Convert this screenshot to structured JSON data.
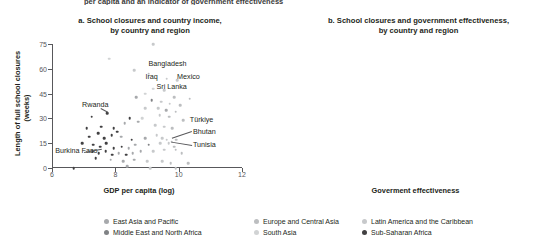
{
  "top_caption": "per capita and an indicator of government effectiveness",
  "panel_a": {
    "title_line1": "a. School closures and country income,",
    "title_line2": "by country and region"
  },
  "panel_b": {
    "title_line1": "b. School closures and government effectiveness,",
    "title_line2": "by country and region"
  },
  "legend": {
    "items": [
      {
        "label": "East Asia and Pacific",
        "color": "#a7a9ac",
        "col": 0,
        "row": 0
      },
      {
        "label": "Middle East and North Africa",
        "color": "#808285",
        "col": 0,
        "row": 1
      },
      {
        "label": "Europe and Central Asia",
        "color": "#bcbec0",
        "col": 1,
        "row": 0
      },
      {
        "label": "South Asia",
        "color": "#d1d3d4",
        "col": 1,
        "row": 1
      },
      {
        "label": "Latin America and the Caribbean",
        "color": "#c7c9cb",
        "col": 2,
        "row": 0
      },
      {
        "label": "Sub-Saharan Africa",
        "color": "#414042",
        "col": 2,
        "row": 1
      }
    ]
  },
  "chart_data": [
    {
      "type": "scatter",
      "panel": "a",
      "title": "a. School closures and country income, by country and region",
      "xlabel": "GDP per capita (log)",
      "ylabel": "Length of full school closures (weeks)",
      "xlim": [
        6,
        12
      ],
      "ylim": [
        0,
        75
      ],
      "xticks": [
        6,
        8,
        10,
        12
      ],
      "yticks": [
        0,
        15,
        30,
        45,
        60,
        75
      ],
      "grid": false,
      "legend_position": "bottom",
      "annotations": [
        {
          "label": "Bangladesh",
          "x": 9.05,
          "y": 63,
          "anchor": "left",
          "leader": false
        },
        {
          "label": "Iraq",
          "x": 8.95,
          "y": 55,
          "anchor": "left",
          "leader": false
        },
        {
          "label": "Mexico",
          "x": 9.95,
          "y": 55,
          "anchor": "left",
          "leader": false
        },
        {
          "label": "Sri Lanka",
          "x": 9.3,
          "y": 49,
          "anchor": "left",
          "leader": false
        },
        {
          "label": "Rwanda",
          "x": 6.95,
          "y": 38,
          "anchor": "left",
          "leader": true
        },
        {
          "label": "Türkiye",
          "x": 10.35,
          "y": 29,
          "anchor": "left",
          "leader": false
        },
        {
          "label": "Bhutan",
          "x": 10.45,
          "y": 22,
          "anchor": "left",
          "leader": true
        },
        {
          "label": "Tunisia",
          "x": 10.45,
          "y": 14,
          "anchor": "left",
          "leader": true
        },
        {
          "label": "Burkina Faso",
          "x": 6.1,
          "y": 10,
          "anchor": "left",
          "leader": true
        }
      ],
      "points": [
        {
          "x": 7.8,
          "y": 66,
          "g": "sa"
        },
        {
          "x": 9.2,
          "y": 75,
          "g": "lac"
        },
        {
          "x": 8.6,
          "y": 59,
          "g": "lac"
        },
        {
          "x": 9.05,
          "y": 57,
          "g": "eca"
        },
        {
          "x": 9.62,
          "y": 54,
          "g": "lac"
        },
        {
          "x": 9.95,
          "y": 53,
          "g": "lac"
        },
        {
          "x": 9.2,
          "y": 48,
          "g": "sa"
        },
        {
          "x": 9.55,
          "y": 47,
          "g": "lac"
        },
        {
          "x": 8.95,
          "y": 45,
          "g": "sa"
        },
        {
          "x": 8.65,
          "y": 43,
          "g": "eap"
        },
        {
          "x": 9.85,
          "y": 43,
          "g": "eca"
        },
        {
          "x": 10.35,
          "y": 42,
          "g": "eca"
        },
        {
          "x": 9.15,
          "y": 41,
          "g": "mena"
        },
        {
          "x": 9.45,
          "y": 40,
          "g": "lac"
        },
        {
          "x": 9.72,
          "y": 39,
          "g": "lac"
        },
        {
          "x": 10.05,
          "y": 38,
          "g": "eca"
        },
        {
          "x": 7.75,
          "y": 33,
          "g": "ssa"
        },
        {
          "x": 8.95,
          "y": 36,
          "g": "lac"
        },
        {
          "x": 9.35,
          "y": 36,
          "g": "lac"
        },
        {
          "x": 9.6,
          "y": 35,
          "g": "eap"
        },
        {
          "x": 9.9,
          "y": 34,
          "g": "eca"
        },
        {
          "x": 7.25,
          "y": 31,
          "g": "ssa"
        },
        {
          "x": 8.45,
          "y": 30,
          "g": "ssa"
        },
        {
          "x": 8.85,
          "y": 30,
          "g": "sa"
        },
        {
          "x": 9.4,
          "y": 32,
          "g": "lac"
        },
        {
          "x": 9.7,
          "y": 31,
          "g": "eca"
        },
        {
          "x": 10.15,
          "y": 29,
          "g": "eca"
        },
        {
          "x": 7.1,
          "y": 24,
          "g": "ssa"
        },
        {
          "x": 7.55,
          "y": 25,
          "g": "ssa"
        },
        {
          "x": 7.95,
          "y": 24,
          "g": "ssa"
        },
        {
          "x": 8.05,
          "y": 22,
          "g": "ssa"
        },
        {
          "x": 8.3,
          "y": 27,
          "g": "eap"
        },
        {
          "x": 8.72,
          "y": 28,
          "g": "eap"
        },
        {
          "x": 9.25,
          "y": 26,
          "g": "lac"
        },
        {
          "x": 9.55,
          "y": 25,
          "g": "lac"
        },
        {
          "x": 9.8,
          "y": 24,
          "g": "eca"
        },
        {
          "x": 7.18,
          "y": 19,
          "g": "ssa"
        },
        {
          "x": 7.45,
          "y": 21,
          "g": "ssa"
        },
        {
          "x": 7.65,
          "y": 18,
          "g": "ssa"
        },
        {
          "x": 7.88,
          "y": 20,
          "g": "ssa"
        },
        {
          "x": 8.18,
          "y": 19,
          "g": "eap"
        },
        {
          "x": 8.52,
          "y": 17,
          "g": "ssa"
        },
        {
          "x": 8.95,
          "y": 18,
          "g": "eap"
        },
        {
          "x": 9.3,
          "y": 20,
          "g": "lac"
        },
        {
          "x": 9.48,
          "y": 18,
          "g": "lac"
        },
        {
          "x": 9.62,
          "y": 17,
          "g": "lac"
        },
        {
          "x": 9.78,
          "y": 16,
          "g": "eca"
        },
        {
          "x": 9.92,
          "y": 17,
          "g": "eca"
        },
        {
          "x": 6.95,
          "y": 15,
          "g": "ssa"
        },
        {
          "x": 7.3,
          "y": 14,
          "g": "ssa"
        },
        {
          "x": 7.52,
          "y": 13,
          "g": "ssa"
        },
        {
          "x": 7.72,
          "y": 15,
          "g": "ssa"
        },
        {
          "x": 7.95,
          "y": 12,
          "g": "ssa"
        },
        {
          "x": 8.2,
          "y": 13,
          "g": "ssa"
        },
        {
          "x": 8.42,
          "y": 12,
          "g": "eap"
        },
        {
          "x": 8.62,
          "y": 14,
          "g": "eap"
        },
        {
          "x": 9.05,
          "y": 14,
          "g": "mena"
        },
        {
          "x": 9.42,
          "y": 15,
          "g": "lac"
        },
        {
          "x": 9.68,
          "y": 15,
          "g": "lac"
        },
        {
          "x": 9.85,
          "y": 13,
          "g": "eca"
        },
        {
          "x": 7.28,
          "y": 10,
          "g": "ssa"
        },
        {
          "x": 7.48,
          "y": 9,
          "g": "ssa"
        },
        {
          "x": 7.7,
          "y": 10,
          "g": "ssa"
        },
        {
          "x": 7.9,
          "y": 8,
          "g": "ssa"
        },
        {
          "x": 8.1,
          "y": 9,
          "g": "eap"
        },
        {
          "x": 8.35,
          "y": 8,
          "g": "ssa"
        },
        {
          "x": 8.55,
          "y": 9,
          "g": "eap"
        },
        {
          "x": 8.8,
          "y": 10,
          "g": "eap"
        },
        {
          "x": 9.2,
          "y": 10,
          "g": "lac"
        },
        {
          "x": 9.55,
          "y": 11,
          "g": "lac"
        },
        {
          "x": 9.9,
          "y": 11,
          "g": "eca"
        },
        {
          "x": 10.1,
          "y": 9,
          "g": "eca"
        },
        {
          "x": 7.38,
          "y": 6,
          "g": "ssa"
        },
        {
          "x": 7.85,
          "y": 5,
          "g": "eap"
        },
        {
          "x": 8.25,
          "y": 4,
          "g": "eap"
        },
        {
          "x": 8.6,
          "y": 5,
          "g": "eap"
        },
        {
          "x": 9.0,
          "y": 4,
          "g": "lac"
        },
        {
          "x": 9.48,
          "y": 4,
          "g": "lac"
        },
        {
          "x": 9.75,
          "y": 3,
          "g": "eca"
        },
        {
          "x": 10.3,
          "y": 3,
          "g": "eca"
        },
        {
          "x": 6.68,
          "y": 0,
          "g": "ssa"
        },
        {
          "x": 8.38,
          "y": 1,
          "g": "eap"
        },
        {
          "x": 9.1,
          "y": 0,
          "g": "lac"
        },
        {
          "x": 9.9,
          "y": 0,
          "g": "eca"
        }
      ]
    },
    {
      "type": "scatter",
      "panel": "b",
      "title": "b. School closures and government effectiveness, by country and region",
      "xlabel": "Goverment effectiveness",
      "ylabel": "Length of full school closures (weeks)",
      "xlim": [
        -3,
        3
      ],
      "ylim": [
        0,
        75
      ],
      "xticks": [
        -3,
        -2,
        -1,
        0,
        1,
        2,
        3
      ],
      "yticks": [
        0,
        15,
        30,
        45,
        60,
        75
      ],
      "grid": false,
      "legend_position": "bottom",
      "annotations": [
        {
          "label": "Uganda",
          "x": -0.4,
          "y": 68,
          "anchor": "left",
          "leader": false
        },
        {
          "label": "Bangladesh",
          "x": -0.5,
          "y": 61,
          "anchor": "left",
          "leader": false
        },
        {
          "label": "Mexico",
          "x": 0.15,
          "y": 54,
          "anchor": "left",
          "leader": false
        },
        {
          "label": "Pakistan",
          "x": -1.2,
          "y": 44,
          "anchor": "left",
          "leader": false
        },
        {
          "label": "Ethiopia",
          "x": -2.35,
          "y": 36,
          "anchor": "left",
          "leader": true
        },
        {
          "label": "Lebanon",
          "x": 0.7,
          "y": 35,
          "anchor": "left",
          "leader": true
        },
        {
          "label": "Colombia",
          "x": 0.0,
          "y": 25,
          "anchor": "left",
          "leader": false
        },
        {
          "label": "Egypt, Arab Rep.",
          "x": 0.75,
          "y": 11,
          "anchor": "left",
          "leader": true
        }
      ],
      "trend_upper": [
        {
          "x": -2.2,
          "y": 36
        },
        {
          "x": -1.5,
          "y": 30
        },
        {
          "x": -0.95,
          "y": 25
        },
        {
          "x": -0.65,
          "y": 32
        },
        {
          "x": -0.3,
          "y": 35
        },
        {
          "x": 0.3,
          "y": 35
        },
        {
          "x": 0.7,
          "y": 34
        }
      ],
      "trend_lower": [
        {
          "x": -1.05,
          "y": 16
        },
        {
          "x": -0.6,
          "y": 16
        },
        {
          "x": 0.0,
          "y": 14
        },
        {
          "x": 0.45,
          "y": 12
        },
        {
          "x": 0.95,
          "y": 10
        }
      ],
      "points": [
        {
          "x": -0.1,
          "y": 75,
          "g": "lac"
        },
        {
          "x": -0.6,
          "y": 66,
          "g": "ssa"
        },
        {
          "x": -0.45,
          "y": 66,
          "g": "sa"
        },
        {
          "x": -1.3,
          "y": 61,
          "g": "lac"
        },
        {
          "x": -0.05,
          "y": 57,
          "g": "lac"
        },
        {
          "x": -1.1,
          "y": 52,
          "g": "sa"
        },
        {
          "x": 0.1,
          "y": 53,
          "g": "lac"
        },
        {
          "x": -0.35,
          "y": 48,
          "g": "lac"
        },
        {
          "x": -0.75,
          "y": 45,
          "g": "sa"
        },
        {
          "x": 0.05,
          "y": 46,
          "g": "lac"
        },
        {
          "x": -0.55,
          "y": 44,
          "g": "lac"
        },
        {
          "x": 0.25,
          "y": 43,
          "g": "eca"
        },
        {
          "x": 0.95,
          "y": 42,
          "g": "eca"
        },
        {
          "x": -0.3,
          "y": 41,
          "g": "lac"
        },
        {
          "x": -0.15,
          "y": 40,
          "g": "lac"
        },
        {
          "x": 0.35,
          "y": 39,
          "g": "eca"
        },
        {
          "x": -0.9,
          "y": 38,
          "g": "mena"
        },
        {
          "x": -0.5,
          "y": 37,
          "g": "lac"
        },
        {
          "x": 0.45,
          "y": 35,
          "g": "eca"
        },
        {
          "x": -1.1,
          "y": 35,
          "g": "ssa"
        },
        {
          "x": -0.2,
          "y": 34,
          "g": "lac"
        },
        {
          "x": 0.15,
          "y": 33,
          "g": "eca"
        },
        {
          "x": -0.7,
          "y": 32,
          "g": "ssa"
        },
        {
          "x": -0.4,
          "y": 31,
          "g": "eap"
        },
        {
          "x": 0.55,
          "y": 31,
          "g": "eca"
        },
        {
          "x": -1.45,
          "y": 30,
          "g": "ssa"
        },
        {
          "x": -1.25,
          "y": 28,
          "g": "ssa"
        },
        {
          "x": -0.85,
          "y": 27,
          "g": "ssa"
        },
        {
          "x": -0.3,
          "y": 26,
          "g": "lac"
        },
        {
          "x": 0.1,
          "y": 26,
          "g": "lac"
        },
        {
          "x": -2.25,
          "y": 19,
          "g": "ssa"
        },
        {
          "x": -1.95,
          "y": 18,
          "g": "eap"
        },
        {
          "x": -1.6,
          "y": 22,
          "g": "ssa"
        },
        {
          "x": -1.45,
          "y": 24,
          "g": "ssa"
        },
        {
          "x": -1.3,
          "y": 22,
          "g": "ssa"
        },
        {
          "x": -1.05,
          "y": 23,
          "g": "ssa"
        },
        {
          "x": -0.75,
          "y": 21,
          "g": "ssa"
        },
        {
          "x": -0.65,
          "y": 19,
          "g": "ssa"
        },
        {
          "x": -0.55,
          "y": 21,
          "g": "eap"
        },
        {
          "x": -0.25,
          "y": 22,
          "g": "lac"
        },
        {
          "x": 0.2,
          "y": 21,
          "g": "eca"
        },
        {
          "x": 0.6,
          "y": 20,
          "g": "eca"
        },
        {
          "x": -1.7,
          "y": 16,
          "g": "ssa"
        },
        {
          "x": -1.5,
          "y": 15,
          "g": "eap"
        },
        {
          "x": -1.35,
          "y": 17,
          "g": "ssa"
        },
        {
          "x": -1.15,
          "y": 16,
          "g": "ssa"
        },
        {
          "x": -0.95,
          "y": 17,
          "g": "ssa"
        },
        {
          "x": -0.8,
          "y": 15,
          "g": "ssa"
        },
        {
          "x": -0.7,
          "y": 16,
          "g": "ssa"
        },
        {
          "x": -0.6,
          "y": 17,
          "g": "ssa"
        },
        {
          "x": -0.5,
          "y": 15,
          "g": "eap"
        },
        {
          "x": -0.35,
          "y": 16,
          "g": "lac"
        },
        {
          "x": -0.15,
          "y": 15,
          "g": "lac"
        },
        {
          "x": 0.3,
          "y": 15,
          "g": "eca"
        },
        {
          "x": 0.5,
          "y": 14,
          "g": "eca"
        },
        {
          "x": -1.55,
          "y": 12,
          "g": "ssa"
        },
        {
          "x": -1.25,
          "y": 11,
          "g": "ssa"
        },
        {
          "x": -1.05,
          "y": 12,
          "g": "ssa"
        },
        {
          "x": -0.9,
          "y": 10,
          "g": "ssa"
        },
        {
          "x": -0.75,
          "y": 11,
          "g": "ssa"
        },
        {
          "x": -0.6,
          "y": 10,
          "g": "ssa"
        },
        {
          "x": -0.45,
          "y": 12,
          "g": "eap"
        },
        {
          "x": -0.25,
          "y": 11,
          "g": "lac"
        },
        {
          "x": -0.05,
          "y": 12,
          "g": "lac"
        },
        {
          "x": 0.2,
          "y": 10,
          "g": "eca"
        },
        {
          "x": 0.45,
          "y": 11,
          "g": "eca"
        },
        {
          "x": -1.4,
          "y": 7,
          "g": "ssa"
        },
        {
          "x": -1.1,
          "y": 6,
          "g": "ssa"
        },
        {
          "x": -0.85,
          "y": 7,
          "g": "eap"
        },
        {
          "x": -0.6,
          "y": 6,
          "g": "ssa"
        },
        {
          "x": -0.35,
          "y": 7,
          "g": "lac"
        },
        {
          "x": -0.1,
          "y": 6,
          "g": "lac"
        },
        {
          "x": 0.15,
          "y": 7,
          "g": "eca"
        },
        {
          "x": 0.7,
          "y": 6,
          "g": "eca"
        },
        {
          "x": -1.5,
          "y": 0,
          "g": "eap"
        },
        {
          "x": -1.2,
          "y": 3,
          "g": "ssa"
        },
        {
          "x": -0.95,
          "y": 1,
          "g": "ssa"
        },
        {
          "x": -0.7,
          "y": 2,
          "g": "eap"
        },
        {
          "x": -0.4,
          "y": 1,
          "g": "lac"
        },
        {
          "x": -0.15,
          "y": 2,
          "g": "lac"
        },
        {
          "x": 0.1,
          "y": 1,
          "g": "eca"
        },
        {
          "x": 0.35,
          "y": 0,
          "g": "eca"
        },
        {
          "x": 0.8,
          "y": 4,
          "g": "eca"
        }
      ]
    }
  ],
  "group_colors": {
    "eap": "#a7a9ac",
    "mena": "#808285",
    "eca": "#bcbec0",
    "sa": "#d1d3d4",
    "lac": "#c7c9cb",
    "ssa": "#414042"
  }
}
